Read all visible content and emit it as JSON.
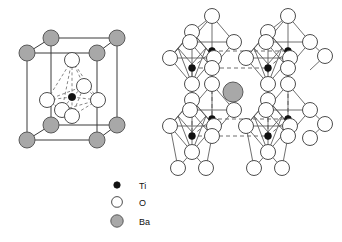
{
  "figure": {
    "background_color": "#ffffff",
    "width": 342,
    "height": 242
  },
  "legend": {
    "position": "bottom-center-left",
    "items": [
      {
        "key": "Ti",
        "label": "Ti",
        "marker": "filled-black-circle",
        "fill": "#111111",
        "stroke": "#111111",
        "radius": 3.2,
        "x": 117,
        "y": 185
      },
      {
        "key": "O",
        "label": "O",
        "marker": "open-white-circle",
        "fill": "#ffffff",
        "stroke": "#4d4d4d",
        "radius": 5.2,
        "x": 117,
        "y": 202
      },
      {
        "key": "Ba",
        "label": "Ba",
        "marker": "gray-filled-circle",
        "fill": "#a8a8a8",
        "stroke": "#5a5a5a",
        "radius": 6.0,
        "x": 117,
        "y": 221
      }
    ],
    "label_x": 139
  },
  "palette": {
    "ti_fill": "#111111",
    "ti_stroke": "#111111",
    "o_fill": "#ffffff",
    "o_stroke": "#4d4d4d",
    "ba_fill": "#a8a8a8",
    "ba_stroke": "#5a5a5a",
    "solid_edge": "#3a3a3a",
    "dashed_edge": "#7a7a7a",
    "text": "#111111"
  },
  "panels": [
    {
      "id": "unit-cell",
      "name": "single-unit-cell",
      "caption": "",
      "description": "Single cubic BaTiO3 unit cell: Ba at the eight cube corners, Ti at the body centre, six O forming an octahedron on the face centres.",
      "atom_counts": {
        "Ba": 8,
        "Ti": 1,
        "O": 6
      },
      "cube": {
        "front_top_left": [
          27,
          53
        ],
        "front_top_right": [
          97,
          53
        ],
        "front_bottom_left": [
          27,
          140
        ],
        "front_bottom_right": [
          97,
          140
        ],
        "back_top_left": [
          51,
          38
        ],
        "back_top_right": [
          117,
          38
        ],
        "back_bottom_left": [
          51,
          125
        ],
        "back_bottom_right": [
          117,
          125
        ]
      },
      "octahedron": {
        "top": [
          72,
          60
        ],
        "bottom": [
          72,
          116
        ],
        "left": [
          47,
          100
        ],
        "right": [
          98,
          100
        ],
        "back": [
          84,
          86
        ],
        "front": [
          62,
          110
        ]
      },
      "ti_center": [
        72,
        97
      ]
    },
    {
      "id": "octahedral-network",
      "name": "corner-sharing-octahedra-network",
      "caption": "",
      "description": "Extended network of corner-sharing TiO6 octahedra with a Ba cation sitting in the central cavity.",
      "atom_counts": {
        "Ba": 1,
        "Ti": 8,
        "O": 30
      },
      "center_ba": [
        233,
        92
      ],
      "bounds": {
        "x": 160,
        "y": 8,
        "width": 180,
        "height": 165
      }
    }
  ]
}
